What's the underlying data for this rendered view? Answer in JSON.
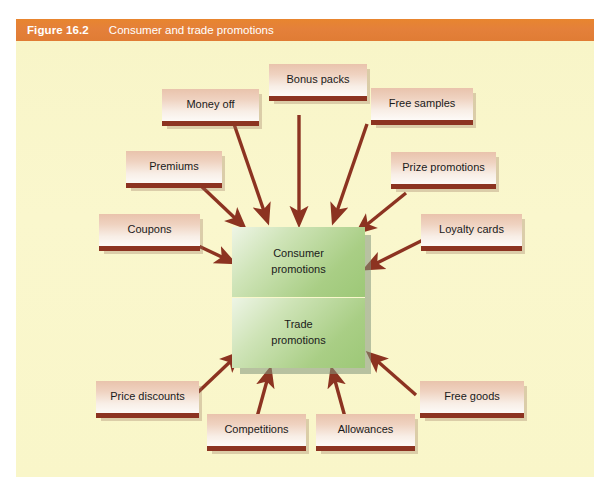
{
  "header": {
    "figure_number": "Figure 16.2",
    "title": "Consumer and trade promotions",
    "bar_color": "#e4803a"
  },
  "canvas": {
    "background_color": "#f9f6c9"
  },
  "center": {
    "consumer": {
      "line1": "Consumer",
      "line2": "promotions"
    },
    "trade": {
      "line1": "Trade",
      "line2": "promotions"
    },
    "fill_color": "#9dc877"
  },
  "nodes": [
    {
      "id": "money-off",
      "label": "Money off"
    },
    {
      "id": "bonus-packs",
      "label": "Bonus packs"
    },
    {
      "id": "free-samples",
      "label": "Free samples"
    },
    {
      "id": "premiums",
      "label": "Premiums"
    },
    {
      "id": "prize-promotions",
      "label": "Prize promotions"
    },
    {
      "id": "coupons",
      "label": "Coupons"
    },
    {
      "id": "loyalty-cards",
      "label": "Loyalty cards"
    },
    {
      "id": "price-discounts",
      "label": "Price discounts"
    },
    {
      "id": "competitions",
      "label": "Competitions"
    },
    {
      "id": "allowances",
      "label": "Allowances"
    },
    {
      "id": "free-goods",
      "label": "Free goods"
    }
  ],
  "style": {
    "node_fill_top": "#e9c3ac",
    "node_fill_bottom": "#fdfaf7",
    "node_underline_color": "#8c3321",
    "arrow_color": "#8c3321"
  }
}
